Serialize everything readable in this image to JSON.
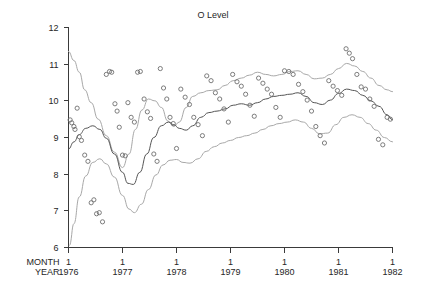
{
  "chart_data": {
    "type": "scatter",
    "title": "O Level",
    "xlabel": "",
    "ylabel": "",
    "grid": false,
    "legend": null,
    "xlim": [
      1976.0,
      1982.0
    ],
    "ylim": [
      6,
      12
    ],
    "y_ticks": [
      6,
      7,
      8,
      9,
      10,
      11,
      12
    ],
    "y_tick_labels": [
      "6",
      "7",
      "8",
      "9",
      "10",
      "11",
      "12"
    ],
    "x_ticks": [
      1976,
      1977,
      1978,
      1979,
      1980,
      1981,
      1982
    ],
    "x_axis_rows": [
      {
        "name": "MONTH",
        "labels": [
          "1",
          "1",
          "1",
          "1",
          "1",
          "1",
          "1"
        ]
      },
      {
        "name": "YEAR",
        "labels": [
          "1976",
          "1977",
          "1978",
          "1979",
          "1980",
          "1981",
          "1982"
        ]
      }
    ],
    "series": [
      {
        "name": "observations",
        "type": "scatter",
        "marker": "open-circle",
        "points": [
          [
            1976.03,
            9.48
          ],
          [
            1976.06,
            9.4
          ],
          [
            1976.1,
            9.3
          ],
          [
            1976.12,
            9.22
          ],
          [
            1976.16,
            9.8
          ],
          [
            1976.2,
            9.02
          ],
          [
            1976.24,
            8.92
          ],
          [
            1976.3,
            8.52
          ],
          [
            1976.36,
            8.35
          ],
          [
            1976.42,
            7.22
          ],
          [
            1976.47,
            7.3
          ],
          [
            1976.52,
            6.92
          ],
          [
            1976.57,
            6.95
          ],
          [
            1976.63,
            6.7
          ],
          [
            1976.7,
            10.72
          ],
          [
            1976.76,
            10.8
          ],
          [
            1976.8,
            10.78
          ],
          [
            1976.86,
            9.92
          ],
          [
            1976.9,
            9.72
          ],
          [
            1976.94,
            9.28
          ],
          [
            1977.0,
            8.52
          ],
          [
            1977.05,
            8.5
          ],
          [
            1977.1,
            9.95
          ],
          [
            1977.16,
            9.55
          ],
          [
            1977.22,
            9.42
          ],
          [
            1977.28,
            10.78
          ],
          [
            1977.33,
            10.8
          ],
          [
            1977.4,
            10.05
          ],
          [
            1977.46,
            9.7
          ],
          [
            1977.52,
            9.52
          ],
          [
            1977.58,
            8.55
          ],
          [
            1977.64,
            8.35
          ],
          [
            1977.7,
            10.88
          ],
          [
            1977.76,
            10.35
          ],
          [
            1977.82,
            10.05
          ],
          [
            1977.88,
            9.55
          ],
          [
            1977.94,
            9.38
          ],
          [
            1978.0,
            8.7
          ],
          [
            1978.08,
            10.32
          ],
          [
            1978.16,
            10.1
          ],
          [
            1978.24,
            9.9
          ],
          [
            1978.32,
            9.55
          ],
          [
            1978.4,
            9.35
          ],
          [
            1978.48,
            9.05
          ],
          [
            1978.56,
            10.68
          ],
          [
            1978.64,
            10.55
          ],
          [
            1978.72,
            10.22
          ],
          [
            1978.8,
            10.05
          ],
          [
            1978.88,
            9.78
          ],
          [
            1978.96,
            9.42
          ],
          [
            1979.04,
            10.72
          ],
          [
            1979.12,
            10.52
          ],
          [
            1979.2,
            10.4
          ],
          [
            1979.28,
            10.18
          ],
          [
            1979.36,
            9.88
          ],
          [
            1979.44,
            9.58
          ],
          [
            1979.52,
            10.62
          ],
          [
            1979.6,
            10.48
          ],
          [
            1979.68,
            10.32
          ],
          [
            1979.76,
            10.18
          ],
          [
            1979.84,
            9.82
          ],
          [
            1979.92,
            9.55
          ],
          [
            1980.0,
            10.82
          ],
          [
            1980.08,
            10.8
          ],
          [
            1980.16,
            10.72
          ],
          [
            1980.26,
            10.45
          ],
          [
            1980.34,
            10.25
          ],
          [
            1980.42,
            10.02
          ],
          [
            1980.5,
            9.72
          ],
          [
            1980.58,
            9.3
          ],
          [
            1980.66,
            9.05
          ],
          [
            1980.74,
            8.85
          ],
          [
            1980.82,
            10.55
          ],
          [
            1980.9,
            10.4
          ],
          [
            1980.98,
            10.28
          ],
          [
            1981.06,
            10.15
          ],
          [
            1981.14,
            11.42
          ],
          [
            1981.2,
            11.3
          ],
          [
            1981.26,
            11.15
          ],
          [
            1981.34,
            10.72
          ],
          [
            1981.42,
            10.38
          ],
          [
            1981.5,
            10.32
          ],
          [
            1981.58,
            10.05
          ],
          [
            1981.66,
            9.85
          ],
          [
            1981.74,
            8.95
          ],
          [
            1981.82,
            8.8
          ],
          [
            1981.9,
            9.55
          ],
          [
            1981.96,
            9.5
          ]
        ]
      },
      {
        "name": "upper-band",
        "type": "line",
        "style": "light",
        "points": [
          [
            1976.0,
            11.35
          ],
          [
            1976.1,
            11.1
          ],
          [
            1976.2,
            10.78
          ],
          [
            1976.3,
            10.3
          ],
          [
            1976.42,
            9.95
          ],
          [
            1976.55,
            9.5
          ],
          [
            1976.7,
            9.05
          ],
          [
            1976.85,
            8.6
          ],
          [
            1977.0,
            8.18
          ],
          [
            1977.12,
            8.55
          ],
          [
            1977.24,
            9.22
          ],
          [
            1977.36,
            9.75
          ],
          [
            1977.48,
            10.05
          ],
          [
            1977.6,
            10.0
          ],
          [
            1977.72,
            9.82
          ],
          [
            1977.84,
            9.45
          ],
          [
            1977.95,
            9.3
          ],
          [
            1978.05,
            9.42
          ],
          [
            1978.18,
            9.82
          ],
          [
            1978.3,
            10.12
          ],
          [
            1978.45,
            10.22
          ],
          [
            1978.6,
            10.28
          ],
          [
            1978.75,
            10.3
          ],
          [
            1978.9,
            10.42
          ],
          [
            1979.05,
            10.55
          ],
          [
            1979.2,
            10.62
          ],
          [
            1979.35,
            10.7
          ],
          [
            1979.5,
            10.78
          ],
          [
            1979.65,
            10.72
          ],
          [
            1979.8,
            10.68
          ],
          [
            1979.95,
            10.72
          ],
          [
            1980.1,
            10.8
          ],
          [
            1980.25,
            10.82
          ],
          [
            1980.4,
            10.72
          ],
          [
            1980.55,
            10.6
          ],
          [
            1980.7,
            10.62
          ],
          [
            1980.85,
            10.72
          ],
          [
            1981.0,
            10.88
          ],
          [
            1981.15,
            11.02
          ],
          [
            1981.3,
            10.95
          ],
          [
            1981.45,
            10.8
          ],
          [
            1981.6,
            10.62
          ],
          [
            1981.75,
            10.42
          ],
          [
            1981.9,
            10.3
          ],
          [
            1982.0,
            10.25
          ]
        ]
      },
      {
        "name": "center-line",
        "type": "line",
        "style": "dark",
        "points": [
          [
            1976.0,
            8.68
          ],
          [
            1976.1,
            8.88
          ],
          [
            1976.2,
            9.08
          ],
          [
            1976.32,
            9.25
          ],
          [
            1976.45,
            9.32
          ],
          [
            1976.58,
            9.22
          ],
          [
            1976.7,
            8.98
          ],
          [
            1976.85,
            8.55
          ],
          [
            1977.0,
            8.05
          ],
          [
            1977.1,
            7.75
          ],
          [
            1977.2,
            7.72
          ],
          [
            1977.32,
            8.05
          ],
          [
            1977.45,
            8.55
          ],
          [
            1977.58,
            9.0
          ],
          [
            1977.72,
            9.32
          ],
          [
            1977.85,
            9.42
          ],
          [
            1977.95,
            9.35
          ],
          [
            1978.05,
            9.25
          ],
          [
            1978.18,
            9.2
          ],
          [
            1978.3,
            9.32
          ],
          [
            1978.45,
            9.55
          ],
          [
            1978.6,
            9.68
          ],
          [
            1978.75,
            9.72
          ],
          [
            1978.9,
            9.78
          ],
          [
            1979.05,
            9.88
          ],
          [
            1979.2,
            9.92
          ],
          [
            1979.35,
            9.88
          ],
          [
            1979.5,
            9.95
          ],
          [
            1979.65,
            10.05
          ],
          [
            1979.8,
            10.12
          ],
          [
            1979.95,
            10.15
          ],
          [
            1980.1,
            10.18
          ],
          [
            1980.25,
            10.22
          ],
          [
            1980.4,
            10.12
          ],
          [
            1980.55,
            9.95
          ],
          [
            1980.7,
            9.9
          ],
          [
            1980.85,
            10.02
          ],
          [
            1981.0,
            10.2
          ],
          [
            1981.15,
            10.32
          ],
          [
            1981.3,
            10.28
          ],
          [
            1981.45,
            10.15
          ],
          [
            1981.6,
            10.0
          ],
          [
            1981.75,
            9.85
          ],
          [
            1981.9,
            9.62
          ],
          [
            1982.0,
            9.48
          ]
        ]
      },
      {
        "name": "lower-band",
        "type": "line",
        "style": "light",
        "points": [
          [
            1976.02,
            6.05
          ],
          [
            1976.1,
            6.65
          ],
          [
            1976.2,
            7.38
          ],
          [
            1976.32,
            7.95
          ],
          [
            1976.45,
            8.32
          ],
          [
            1976.58,
            8.42
          ],
          [
            1976.7,
            8.28
          ],
          [
            1976.85,
            7.92
          ],
          [
            1977.0,
            7.42
          ],
          [
            1977.12,
            7.05
          ],
          [
            1977.22,
            6.95
          ],
          [
            1977.35,
            7.18
          ],
          [
            1977.48,
            7.58
          ],
          [
            1977.62,
            7.98
          ],
          [
            1977.75,
            8.25
          ],
          [
            1977.88,
            8.38
          ],
          [
            1978.0,
            8.4
          ],
          [
            1978.12,
            8.32
          ],
          [
            1978.25,
            8.3
          ],
          [
            1978.4,
            8.42
          ],
          [
            1978.55,
            8.62
          ],
          [
            1978.7,
            8.75
          ],
          [
            1978.85,
            8.85
          ],
          [
            1979.0,
            8.92
          ],
          [
            1979.15,
            9.0
          ],
          [
            1979.3,
            9.05
          ],
          [
            1979.45,
            9.12
          ],
          [
            1979.6,
            9.22
          ],
          [
            1979.75,
            9.32
          ],
          [
            1979.9,
            9.38
          ],
          [
            1980.05,
            9.42
          ],
          [
            1980.2,
            9.48
          ],
          [
            1980.35,
            9.42
          ],
          [
            1980.5,
            9.25
          ],
          [
            1980.65,
            9.1
          ],
          [
            1980.8,
            9.12
          ],
          [
            1980.95,
            9.35
          ],
          [
            1981.1,
            9.55
          ],
          [
            1981.25,
            9.62
          ],
          [
            1981.4,
            9.55
          ],
          [
            1981.55,
            9.38
          ],
          [
            1981.7,
            9.2
          ],
          [
            1981.85,
            9.0
          ],
          [
            1982.0,
            8.88
          ]
        ]
      }
    ]
  },
  "colors": {
    "axis": "#3a3a3a",
    "text": "#262626",
    "center_line": "#555555",
    "band_line": "#a8a8a8",
    "marker": "#6e6e6e",
    "background": "#ffffff"
  }
}
